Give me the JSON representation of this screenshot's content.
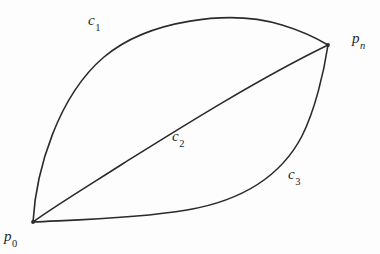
{
  "figure": {
    "background_color": "#fdfdfd",
    "stroke_color": "#2b2b2b",
    "label_color": "#1f1f1f",
    "width": 380,
    "height": 254
  },
  "labels": {
    "c1": {
      "base": "c",
      "sub": "1",
      "x": 88,
      "y": 13
    },
    "c2": {
      "base": "c",
      "sub": "2",
      "x": 172,
      "y": 129
    },
    "c3": {
      "base": "c",
      "sub": "3",
      "x": 288,
      "y": 167
    },
    "pn": {
      "base": "p",
      "sub": "n",
      "x": 352,
      "y": 31
    },
    "p0": {
      "base": "p",
      "sub": "0",
      "x": 4,
      "y": 229
    }
  },
  "geometry": {
    "p0_point": {
      "x": 33,
      "y": 222
    },
    "pn_point": {
      "x": 328,
      "y": 45
    },
    "curve_c1_path": "M 33 222 C 36 170 58 96 104 57 C 148 20 230 9 282 25 C 302 31 318 39 328 45",
    "curve_c2_path": "M 33 222 C 52 208 88 186 124 163 C 180 128 258 79 328 45",
    "curve_c3_path": "M 33 222 C 70 220 134 219 187 210 C 240 201 280 178 302 136 C 315 110 324 72 328 45"
  }
}
